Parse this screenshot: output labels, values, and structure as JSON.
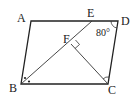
{
  "diagram": {
    "type": "geometry",
    "shape": "parallelogram ABCD",
    "points": {
      "A": {
        "label": "A",
        "x": 31,
        "y": 21
      },
      "D": {
        "label": "D",
        "x": 118,
        "y": 21
      },
      "B": {
        "label": "B",
        "x": 21,
        "y": 84
      },
      "C": {
        "label": "C",
        "x": 108,
        "y": 84
      },
      "E": {
        "label": "E",
        "x": 92,
        "y": 21
      },
      "F": {
        "label": "F",
        "x": 71,
        "y": 44
      }
    },
    "segments": [
      "AB",
      "BC",
      "CD",
      "DA",
      "BE",
      "CF"
    ],
    "angle_label": "80°",
    "annotations": {
      "right_angle_at": "F",
      "angle_D": "80°",
      "equal_angles_at_B": "two dots (BE bisects angle B)",
      "angle_mark_at_C": "arc"
    }
  }
}
